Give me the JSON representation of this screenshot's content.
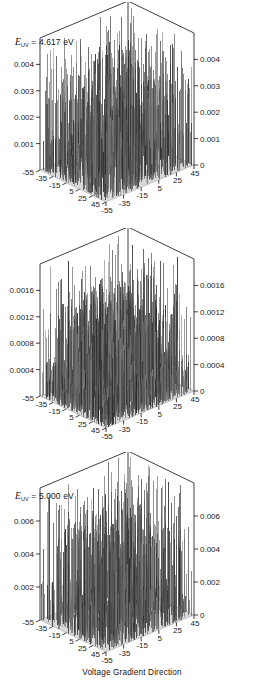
{
  "figure": {
    "caption": "Voltage Gradient Direction",
    "panel_count": 3
  },
  "chart_data": [
    {
      "type": "surface",
      "panel_index": 0,
      "title": "E_UV = 4.617 eV",
      "energy_symbol": "E",
      "energy_subscript": "UV",
      "energy_value": "4.617",
      "energy_unit": "eV",
      "xlabel": "",
      "ylabel": "",
      "zlabel": "",
      "grid": false,
      "legend": "none",
      "zlim": [
        0,
        0.005
      ],
      "z_ticks_left": [
        "0.004",
        "0.003",
        "0.002",
        "0.001"
      ],
      "z_ticks_right": [
        "0.004",
        "0.003",
        "0.002",
        "0.001",
        "0"
      ],
      "x_ticks": [
        "-55",
        "-35",
        "-15",
        "5",
        "25",
        "45"
      ],
      "y_ticks": [
        "-55",
        "-35",
        "-15",
        "5",
        "25",
        "45"
      ],
      "xlim": [
        -55,
        45
      ],
      "ylim": [
        -55,
        45
      ],
      "peak_max": 0.0045,
      "noise_floor": 0.0002,
      "spike_density": "high",
      "description": "Dense field of narrow vertical spikes rising from a flat light-gray base plane over a square x-y grid"
    },
    {
      "type": "surface",
      "panel_index": 1,
      "title": "E_UV = 5.000 eV",
      "energy_symbol": "E",
      "energy_subscript": "UV",
      "energy_value": "5.000",
      "energy_unit": "eV",
      "xlabel": "",
      "ylabel": "",
      "zlabel": "",
      "grid": false,
      "legend": "none",
      "zlim": [
        0,
        0.002
      ],
      "z_ticks_left": [
        "0.0016",
        "0.0012",
        "0.0008",
        "0.0004"
      ],
      "z_ticks_right": [
        "0.0016",
        "0.0012",
        "0.0008",
        "0.0004",
        "0"
      ],
      "x_ticks": [
        "-55",
        "-35",
        "-15",
        "5",
        "25",
        "45"
      ],
      "y_ticks": [
        "-55",
        "-35",
        "-15",
        "5",
        "25",
        "45"
      ],
      "xlim": [
        -55,
        45
      ],
      "ylim": [
        -55,
        45
      ],
      "peak_max": 0.0018,
      "noise_floor": 0.00015,
      "spike_density": "very high",
      "description": "Very dense carpet of short spikes with a few tall outliers reaching the top of the z-range"
    },
    {
      "type": "surface",
      "panel_index": 2,
      "title": "E_UV = 5.260 eV",
      "energy_symbol": "E",
      "energy_subscript": "UV",
      "energy_value": "5.260",
      "energy_unit": "eV",
      "xlabel": "Voltage Gradient Direction",
      "ylabel": "",
      "zlabel": "",
      "grid": false,
      "legend": "none",
      "zlim": [
        0,
        0.007
      ],
      "z_ticks_left": [
        "0.006",
        "0.004",
        "0.002"
      ],
      "z_ticks_right": [
        "0.006",
        "0.004",
        "0.002",
        "0"
      ],
      "x_ticks": [
        "-55",
        "-35",
        "-15",
        "5",
        "25",
        "45"
      ],
      "y_ticks": [
        "-55",
        "-35",
        "-15",
        "5",
        "25",
        "45"
      ],
      "xlim": [
        -55,
        45
      ],
      "ylim": [
        -55,
        45
      ],
      "peak_max": 0.0062,
      "noise_floor": 0.0003,
      "spike_density": "medium-high",
      "description": "Sparser but taller spikes scattered across the base plane, several reaching near the z-axis maximum"
    }
  ]
}
